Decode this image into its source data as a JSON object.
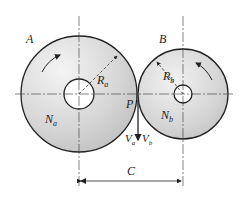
{
  "diagram": {
    "type": "friction-wheels",
    "labels": {
      "wheel_a": "A",
      "wheel_b": "B",
      "radius_a": {
        "main": "R",
        "sub": "a"
      },
      "radius_b": {
        "main": "R",
        "sub": "b"
      },
      "speed_a": {
        "main": "N",
        "sub": "a"
      },
      "speed_b": {
        "main": "N",
        "sub": "b"
      },
      "contact_point": "P",
      "velocity_a": {
        "main": "V",
        "sub": "a"
      },
      "velocity_b": {
        "main": "V",
        "sub": "b"
      },
      "center_distance": "C"
    },
    "colors": {
      "outline": "#222222",
      "fill_light": "#f2f2f2",
      "fill_dark": "#bdbdbd",
      "background": "#ffffff"
    }
  }
}
